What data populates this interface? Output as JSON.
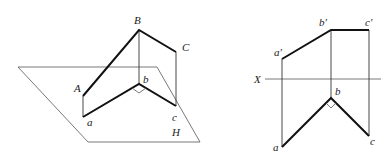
{
  "left_view": {
    "plane_label": "H",
    "points": {
      "A": "A",
      "B": "B",
      "C": "C",
      "a": "a",
      "b": "b",
      "c": "c"
    }
  },
  "right_view": {
    "axis_label": "X",
    "points": {
      "a_prime": "a′",
      "b_prime": "b′",
      "c_prime": "c′",
      "a": "a",
      "b": "b",
      "c": "c"
    }
  },
  "colors": {
    "line": "#111111",
    "thin": "#555555",
    "background": "#ffffff"
  }
}
